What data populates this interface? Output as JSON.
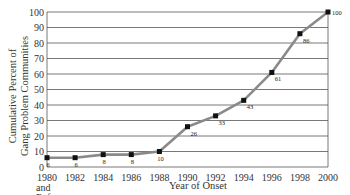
{
  "chart_data": {
    "type": "line",
    "title": "",
    "xlabel": "Year of Onset",
    "ylabel": "Cumulative Percent of Gang Problem Communities",
    "ylabel_lines": [
      "Cumulative Percent of",
      "Gang Problem Communities"
    ],
    "categories": [
      "1980 and Before",
      "1982",
      "1984",
      "1986",
      "1988",
      "1990",
      "1992",
      "1994",
      "1996",
      "1998",
      "2000"
    ],
    "x_tick_labels": [
      "1980",
      "1982",
      "1984",
      "1986",
      "1988",
      "1990",
      "1992",
      "1994",
      "1996",
      "1998",
      "2000"
    ],
    "x_tick_sublabel": [
      "and",
      "Before"
    ],
    "series": [
      {
        "name": "Cumulative Percent",
        "values": [
          6,
          6,
          8,
          8,
          10,
          26,
          33,
          43,
          61,
          86,
          100
        ]
      }
    ],
    "data_labels": [
      "6",
      "6",
      "8",
      "8",
      "10",
      "26",
      "33",
      "43",
      "61",
      "86",
      "100"
    ],
    "y_ticks": [
      0,
      10,
      20,
      30,
      40,
      50,
      60,
      70,
      80,
      90,
      100
    ],
    "ylim": [
      0,
      100
    ],
    "grid": "horizontal",
    "legend": "none",
    "colors": {
      "line": "#8a8a8a",
      "marker": "#111111",
      "grid": "#555555"
    }
  }
}
